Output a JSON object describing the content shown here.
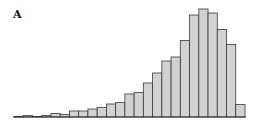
{
  "panel": {
    "label": "A"
  },
  "chart_data": {
    "type": "bar",
    "title": "",
    "panel_label": "A",
    "xlabel": "",
    "ylabel": "",
    "grid": false,
    "legend": null,
    "axes_visible": {
      "x_ticks": false,
      "y_ticks": false
    },
    "bin_count": 25,
    "categories": [
      "1",
      "2",
      "3",
      "4",
      "5",
      "6",
      "7",
      "8",
      "9",
      "10",
      "11",
      "12",
      "13",
      "14",
      "15",
      "16",
      "17",
      "18",
      "19",
      "20",
      "21",
      "22",
      "23",
      "24",
      "25"
    ],
    "values": [
      0.5,
      1.5,
      0.5,
      1.5,
      3.5,
      2.5,
      6,
      6,
      8,
      9.5,
      13,
      14.5,
      23,
      24.5,
      34,
      44,
      56,
      60,
      76.5,
      102,
      108,
      104,
      87.5,
      72.5,
      12.5
    ],
    "value_units": "relative frequency (px height; no axis labels shown)",
    "ylim": [
      0,
      110
    ],
    "colors": {
      "bar_fill": "#d2d2d2",
      "bar_stroke": "#3a3a3a"
    }
  }
}
